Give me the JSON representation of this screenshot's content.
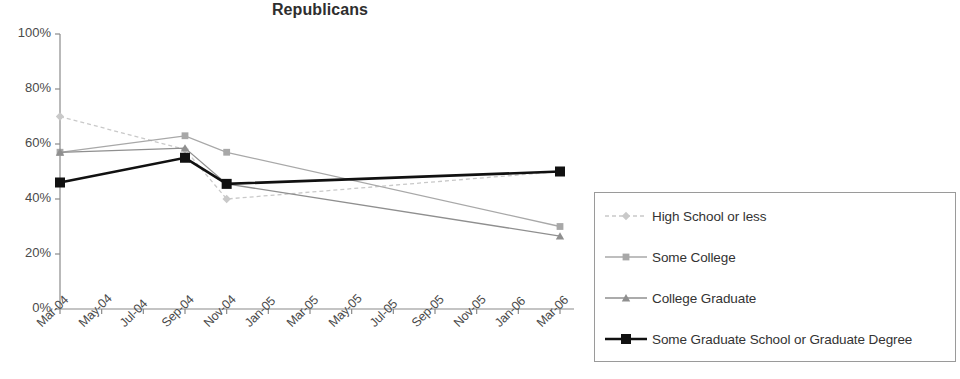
{
  "chart_data": {
    "type": "line",
    "title": "Republicans",
    "xlabel": "",
    "ylabel": "",
    "ylim": [
      0,
      100
    ],
    "ytick_labels": [
      "0%",
      "20%",
      "40%",
      "60%",
      "80%",
      "100%"
    ],
    "ytick_values": [
      0,
      20,
      40,
      60,
      80,
      100
    ],
    "grid": false,
    "legend_position": "right",
    "categories": [
      "Mar-04",
      "May-04",
      "Jul-04",
      "Sep-04",
      "Nov-04",
      "Jan-05",
      "Mar-05",
      "May-05",
      "Jul-05",
      "Sep-05",
      "Nov-05",
      "Jan-06",
      "Mar-06"
    ],
    "series": [
      {
        "name": "High School or less",
        "color": "#c9c9c9",
        "marker": "diamond",
        "points": [
          {
            "x": "Mar-04",
            "y": 70
          },
          {
            "x": "Sep-04",
            "y": 58
          },
          {
            "x": "Nov-04",
            "y": 40
          },
          {
            "x": "Mar-06",
            "y": 50
          }
        ]
      },
      {
        "name": "Some College",
        "color": "#a8a8a8",
        "marker": "square",
        "points": [
          {
            "x": "Mar-04",
            "y": 57
          },
          {
            "x": "Sep-04",
            "y": 63
          },
          {
            "x": "Nov-04",
            "y": 57
          },
          {
            "x": "Mar-06",
            "y": 30
          }
        ]
      },
      {
        "name": "College Graduate",
        "color": "#8f8f8f",
        "marker": "triangle",
        "points": [
          {
            "x": "Mar-04",
            "y": 57
          },
          {
            "x": "Sep-04",
            "y": 58.5
          },
          {
            "x": "Nov-04",
            "y": 45.5
          },
          {
            "x": "Mar-06",
            "y": 26.5
          }
        ]
      },
      {
        "name": "Some Graduate School or Graduate Degree",
        "color": "#111111",
        "marker": "square",
        "points": [
          {
            "x": "Mar-04",
            "y": 46
          },
          {
            "x": "Sep-04",
            "y": 55
          },
          {
            "x": "Nov-04",
            "y": 45.5
          },
          {
            "x": "Mar-06",
            "y": 50
          }
        ]
      }
    ]
  },
  "legend": {
    "items": [
      {
        "label": "High School or less"
      },
      {
        "label": "Some College"
      },
      {
        "label": "College Graduate"
      },
      {
        "label": "Some Graduate School or Graduate Degree"
      }
    ]
  },
  "axis": {
    "line_color": "#8a8a8a"
  }
}
